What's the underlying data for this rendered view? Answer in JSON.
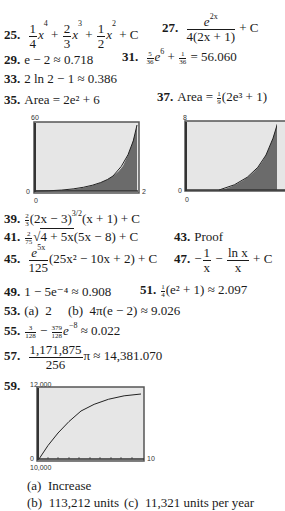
{
  "answers": [
    {
      "n": "25.",
      "parts": {
        "c1n": "1",
        "c1d": "4",
        "t1": "x",
        "e1": "4",
        "c2n": "2",
        "c2d": "3",
        "t2": "x",
        "e2": "3",
        "c3n": "1",
        "c3d": "2",
        "t3": "x",
        "e3": "2",
        "tail": "+ C"
      }
    },
    {
      "n": "27.",
      "parts": {
        "num": "e",
        "numexp": "2x",
        "den": "4(2x + 1)",
        "tail": "+ C"
      }
    },
    {
      "n": "29.",
      "text": "e − 2 ≈ 0.718"
    },
    {
      "n": "31.",
      "parts": {
        "f1n": "5",
        "f1d": "36",
        "exp": "6",
        "f2n": "1",
        "f2d": "36",
        "result": "= 56.060"
      }
    },
    {
      "n": "33.",
      "text": "2 ln 2 − 1 ≈ 0.386"
    },
    {
      "n": "35.",
      "text": "Area = 2e² + 6"
    },
    {
      "n": "37.",
      "parts": {
        "pre": "Area = ",
        "fn": "1",
        "fd": "9",
        "post": "(2e³ + 1)"
      }
    },
    {
      "n": "39.",
      "parts": {
        "fn": "2",
        "fd": "3",
        "body": "(2x − 3)",
        "exp": "3/2",
        "tail": "(x + 1) + C"
      }
    },
    {
      "n": "41.",
      "parts": {
        "fn": "2",
        "fd": "75",
        "radicand": "4 + 5x",
        "tail": "(5x − 8) + C"
      }
    },
    {
      "n": "43.",
      "text": "Proof"
    },
    {
      "n": "45.",
      "parts": {
        "num": "e",
        "numexp": "5x",
        "den": "125",
        "tail": "(25x² − 10x + 2) + C"
      }
    },
    {
      "n": "47.",
      "parts": {
        "f1n": "1",
        "f1d": "x",
        "f2n": "ln x",
        "f2d": "x",
        "tail": "+ C"
      }
    },
    {
      "n": "49.",
      "text": "1 − 5e⁻⁴ ≈ 0.908"
    },
    {
      "n": "51.",
      "parts": {
        "fn": "1",
        "fd": "4",
        "post": "(e² + 1) ≈ 2.097"
      }
    },
    {
      "n": "53.",
      "text": "(a)  2     (b)  4π(e − 2) ≈ 9.026"
    },
    {
      "n": "55.",
      "parts": {
        "f1n": "3",
        "f1d": "128",
        "f2n": "379",
        "f2d": "128",
        "exp": "−8",
        "result": "≈ 0.022"
      }
    },
    {
      "n": "57.",
      "parts": {
        "num": "1,171,875",
        "den": "256",
        "tail": "π ≈ 14,381.070"
      }
    },
    {
      "n": "59."
    }
  ],
  "graphs": [
    {
      "id": "g35",
      "ymax": "60",
      "ymin": "0",
      "xmin": "0",
      "xmax": "2"
    },
    {
      "id": "g37",
      "ymax": "8",
      "ymin": "0",
      "xmin": "0"
    },
    {
      "id": "g59",
      "ymax": "12,000",
      "ymin": "0",
      "xmin": "10,000",
      "xmax": "10"
    }
  ],
  "item59": {
    "a": "(a)  Increase",
    "b": "(b)  113,212 units",
    "c": "(c)  11,321 units per year"
  },
  "colors": {
    "frame": "#555555",
    "plot_bg": "#e6e6e6",
    "shade": "#6b6b6b",
    "curve": "#222222"
  }
}
